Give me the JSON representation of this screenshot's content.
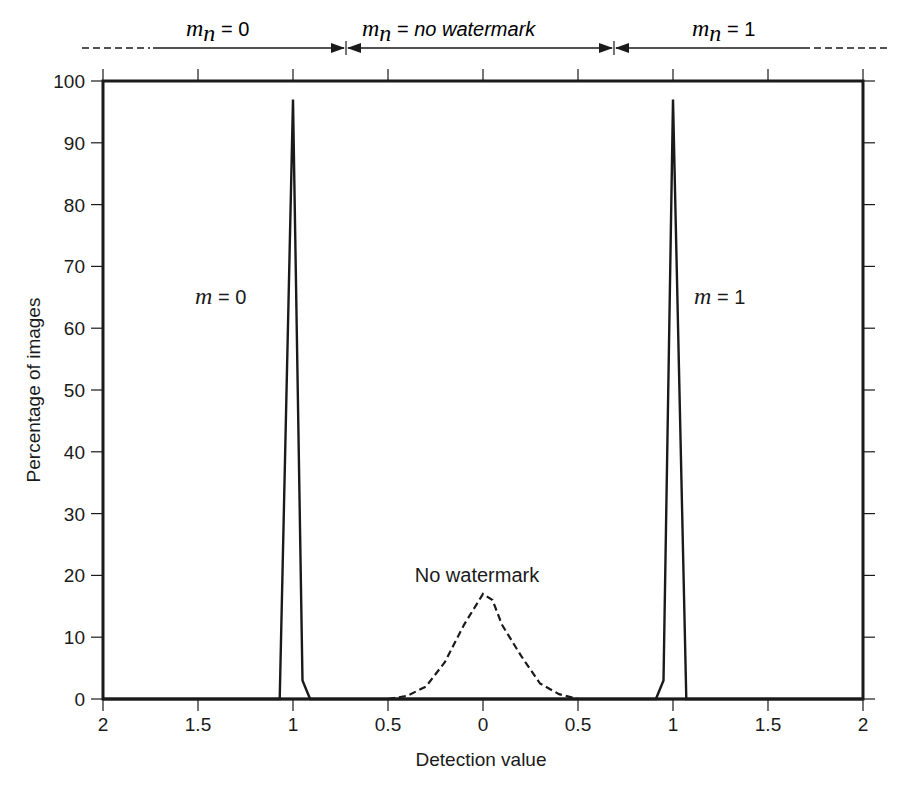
{
  "chart_data": {
    "type": "line",
    "title": "",
    "xlabel": "Detection value",
    "ylabel": "Percentage of images",
    "x_tick_labels": [
      "2",
      "1.5",
      "1",
      "0.5",
      "0",
      "0.5",
      "1",
      "1.5",
      "2"
    ],
    "x_tick_positions": [
      -2,
      -1.5,
      -1,
      -0.5,
      0,
      0.5,
      1,
      1.5,
      2
    ],
    "y_tick_labels": [
      "0",
      "10",
      "20",
      "30",
      "40",
      "50",
      "60",
      "70",
      "80",
      "90",
      "100"
    ],
    "xlim": [
      -2,
      2
    ],
    "ylim": [
      0,
      100
    ],
    "grid": false,
    "legend": "none",
    "series": [
      {
        "name": "m = 0",
        "style": "solid",
        "x": [
          -2.0,
          -1.07,
          -1.0,
          -0.95,
          -0.91,
          2.0
        ],
        "y": [
          0,
          0,
          97,
          3,
          0,
          0
        ]
      },
      {
        "name": "m = 1",
        "style": "solid",
        "x": [
          -2.0,
          0.91,
          0.95,
          1.0,
          1.07,
          2.0
        ],
        "y": [
          0,
          0,
          3,
          97,
          0,
          0
        ]
      },
      {
        "name": "No watermark",
        "style": "dashed",
        "x": [
          -0.5,
          -0.4,
          -0.3,
          -0.2,
          -0.1,
          0.0,
          0.05,
          0.1,
          0.2,
          0.3,
          0.4,
          0.5
        ],
        "y": [
          0,
          0.5,
          2,
          6,
          12,
          17,
          16,
          12,
          7,
          2.5,
          0.8,
          0
        ]
      }
    ],
    "annotations": [
      {
        "text": "m = 0",
        "x": -1.25,
        "y": 63
      },
      {
        "text": "m = 1",
        "x": 1.25,
        "y": 63
      },
      {
        "text": "No watermark",
        "x": 0,
        "y": 20
      }
    ],
    "decision_regions": [
      {
        "label_var": "m",
        "label_sub": "n",
        "label_rest": " = 0",
        "from": -2,
        "to": -0.7
      },
      {
        "label_var": "m",
        "label_sub": "n",
        "label_rest": " = ",
        "label_italic": "no watermark",
        "from": -0.7,
        "to": 0.7
      },
      {
        "label_var": "m",
        "label_sub": "n",
        "label_rest": " = 1",
        "from": 0.7,
        "to": 2
      }
    ]
  },
  "labels": {
    "xlabel": "Detection value",
    "ylabel": "Percentage of images",
    "m0_var": "m",
    "m0_rest": " = 0",
    "m1_var": "m",
    "m1_rest": " = 1",
    "nowm": "No watermark",
    "reg0_var": "m",
    "reg0_sub": "n",
    "reg0_rest": " = 0",
    "reg1_var": "m",
    "reg1_sub": "n",
    "reg1_rest": " = ",
    "reg1_italic": "no watermark",
    "reg2_var": "m",
    "reg2_sub": "n",
    "reg2_rest": " = 1"
  }
}
